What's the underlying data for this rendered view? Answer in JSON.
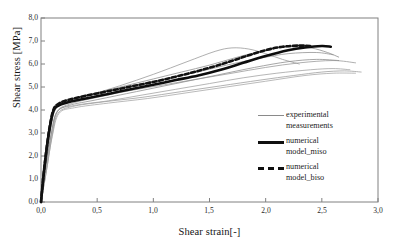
{
  "chart_data": {
    "type": "line",
    "title": "",
    "xlabel": "Shear strain[-]",
    "ylabel": "Shear stress [MPa]",
    "xlim": [
      0.0,
      3.0
    ],
    "ylim": [
      0.0,
      8.0
    ],
    "xticks": [
      "0,0",
      "0,5",
      "1,0",
      "1,5",
      "2,0",
      "2,5",
      "3,0"
    ],
    "xtick_values": [
      0.0,
      0.5,
      1.0,
      1.5,
      2.0,
      2.5,
      3.0
    ],
    "yticks": [
      "0,0",
      "1,0",
      "2,0",
      "3,0",
      "4,0",
      "5,0",
      "6,0",
      "7,0",
      "8,0"
    ],
    "ytick_values": [
      0.0,
      1.0,
      2.0,
      3.0,
      4.0,
      5.0,
      6.0,
      7.0,
      8.0
    ],
    "grid": false,
    "legend_position": "right-inside",
    "legend": [
      {
        "label": "experimental\nmeasurements",
        "style": "thin-solid",
        "color": "#8a8a8a"
      },
      {
        "label": "numerical\nmodel_miso",
        "style": "thick-solid",
        "color": "#101010"
      },
      {
        "label": "numerical\nmodel_biso",
        "style": "thick-dashed",
        "color": "#101010"
      }
    ],
    "series": [
      {
        "name": "experimental measurement 1",
        "style": "thin-solid",
        "color": "#8f8f8f",
        "x": [
          0.0,
          0.04,
          0.08,
          0.12,
          0.18,
          0.3,
          0.5,
          0.75,
          1.0,
          1.25,
          1.5,
          1.75,
          2.0,
          2.2,
          2.4,
          2.55,
          2.65
        ],
        "y": [
          0.0,
          1.6,
          3.1,
          4.0,
          4.35,
          4.5,
          4.75,
          5.05,
          5.35,
          5.65,
          5.95,
          6.3,
          6.6,
          6.75,
          6.7,
          6.5,
          6.3
        ]
      },
      {
        "name": "experimental measurement 2",
        "style": "thin-solid",
        "color": "#9a9a9a",
        "x": [
          0.0,
          0.04,
          0.08,
          0.12,
          0.2,
          0.4,
          0.7,
          1.0,
          1.3,
          1.55,
          1.7,
          1.85,
          2.0,
          2.15,
          2.3
        ],
        "y": [
          0.0,
          1.5,
          3.0,
          3.95,
          4.3,
          4.6,
          5.05,
          5.55,
          6.1,
          6.55,
          6.7,
          6.65,
          6.45,
          6.2,
          6.0
        ]
      },
      {
        "name": "experimental measurement 3",
        "style": "thin-solid",
        "color": "#9a9a9a",
        "x": [
          0.0,
          0.04,
          0.09,
          0.14,
          0.25,
          0.5,
          0.8,
          1.1,
          1.4,
          1.7,
          2.0,
          2.3,
          2.6,
          2.8
        ],
        "y": [
          0.0,
          1.4,
          2.9,
          3.9,
          4.25,
          4.55,
          4.85,
          5.1,
          5.35,
          5.6,
          5.85,
          6.05,
          6.15,
          6.05
        ]
      },
      {
        "name": "experimental measurement 4",
        "style": "thin-solid",
        "color": "#a3a3a3",
        "x": [
          0.0,
          0.05,
          0.1,
          0.15,
          0.3,
          0.6,
          0.9,
          1.2,
          1.5,
          1.8,
          2.1,
          2.4,
          2.6,
          2.75
        ],
        "y": [
          0.0,
          1.5,
          3.0,
          3.95,
          4.2,
          4.4,
          4.65,
          4.9,
          5.15,
          5.4,
          5.6,
          5.75,
          5.8,
          5.75
        ]
      },
      {
        "name": "experimental measurement 5",
        "style": "thin-solid",
        "color": "#a8a8a8",
        "x": [
          0.0,
          0.05,
          0.1,
          0.16,
          0.3,
          0.6,
          0.95,
          1.3,
          1.65,
          2.0,
          2.35,
          2.6,
          2.8
        ],
        "y": [
          0.0,
          1.4,
          2.85,
          3.85,
          4.1,
          4.3,
          4.5,
          4.75,
          5.0,
          5.25,
          5.5,
          5.6,
          5.6
        ]
      },
      {
        "name": "experimental measurement 6",
        "style": "thin-solid",
        "color": "#939393",
        "x": [
          0.0,
          0.04,
          0.08,
          0.13,
          0.22,
          0.45,
          0.75,
          1.05,
          1.35,
          1.65,
          1.95,
          2.2,
          2.45,
          2.6
        ],
        "y": [
          0.0,
          1.55,
          3.05,
          4.05,
          4.4,
          4.7,
          5.0,
          5.3,
          5.6,
          5.95,
          6.25,
          6.45,
          6.5,
          6.4
        ]
      },
      {
        "name": "experimental measurement 7",
        "style": "thin-solid",
        "color": "#8f8f8f",
        "x": [
          0.0,
          0.04,
          0.09,
          0.14,
          0.25,
          0.5,
          0.85,
          1.2,
          1.55,
          1.9,
          2.2,
          2.45,
          2.65
        ],
        "y": [
          0.0,
          1.45,
          2.95,
          3.9,
          4.2,
          4.45,
          4.8,
          5.15,
          5.5,
          5.85,
          6.1,
          6.2,
          6.15
        ]
      },
      {
        "name": "experimental measurement 8",
        "style": "thin-solid",
        "color": "#a0a0a0",
        "x": [
          0.0,
          0.05,
          0.1,
          0.15,
          0.28,
          0.55,
          0.9,
          1.25,
          1.6,
          1.95,
          2.25,
          2.5,
          2.7,
          2.85
        ],
        "y": [
          0.0,
          1.4,
          2.9,
          3.85,
          4.15,
          4.35,
          4.55,
          4.8,
          5.05,
          5.3,
          5.5,
          5.65,
          5.7,
          5.65
        ]
      },
      {
        "name": "numerical model_miso",
        "style": "thick-solid",
        "color": "#0d0d0d",
        "x": [
          0.0,
          0.03,
          0.07,
          0.11,
          0.16,
          0.25,
          0.4,
          0.6,
          0.8,
          1.0,
          1.2,
          1.4,
          1.6,
          1.8,
          2.0,
          2.2,
          2.35,
          2.5,
          2.58
        ],
        "y": [
          0.0,
          1.5,
          3.0,
          3.95,
          4.2,
          4.35,
          4.5,
          4.7,
          4.9,
          5.1,
          5.3,
          5.5,
          5.75,
          6.05,
          6.35,
          6.6,
          6.72,
          6.78,
          6.75
        ]
      },
      {
        "name": "numerical model_biso",
        "style": "thick-dashed",
        "color": "#111111",
        "x": [
          0.0,
          0.03,
          0.07,
          0.11,
          0.16,
          0.25,
          0.4,
          0.6,
          0.8,
          1.0,
          1.2,
          1.4,
          1.6,
          1.8,
          2.0,
          2.15,
          2.3,
          2.4
        ],
        "y": [
          0.0,
          1.5,
          3.05,
          4.0,
          4.28,
          4.45,
          4.62,
          4.82,
          5.02,
          5.22,
          5.45,
          5.7,
          5.98,
          6.3,
          6.6,
          6.75,
          6.8,
          6.78
        ]
      }
    ]
  },
  "axes": {
    "frame_color": "#808080"
  }
}
